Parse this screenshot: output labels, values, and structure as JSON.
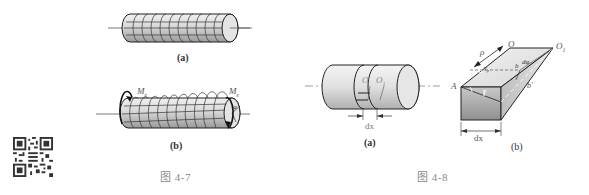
{
  "figure_4_7": {
    "caption": "图 4-7",
    "sub_a": {
      "label": "(a)"
    },
    "sub_b": {
      "label": "(b)",
      "torque_left": "M",
      "torque_left_sub": "e",
      "torque_right": "M",
      "torque_right_sub": "e",
      "angle": "φ"
    }
  },
  "figure_4_8": {
    "caption": "图 4-8",
    "sub_a": {
      "label": "(a)",
      "center_left": "O",
      "center_right": "O",
      "center_right_sub": "1",
      "width_dim": "dx"
    },
    "sub_b": {
      "label": "(b)",
      "O": "O",
      "O1": "O",
      "O1_sub": "1",
      "rho": "ρ",
      "A": "A",
      "a": "a",
      "b": "b",
      "b_prime": "b'",
      "gamma": "γ",
      "gamma_rho": "γ",
      "gamma_rho_sub": "ρ",
      "dphi": "dφ",
      "width_dim": "dx"
    }
  },
  "qr_code": {
    "name": "qr-code"
  },
  "colors": {
    "outline": "#2a2a2a",
    "fill_light": "#e6e6e6",
    "fill_dark": "#a8a8a8",
    "caption": "#8a8a8a",
    "axis": "#555555"
  }
}
